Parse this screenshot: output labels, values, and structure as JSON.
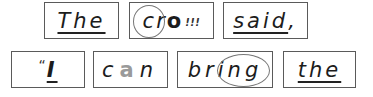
{
  "figure": {
    "rows": [
      {
        "words": [
          {
            "text": "The",
            "annotation": "underlined"
          },
          {
            "text": "crow",
            "parts": {
              "plain": "cr",
              "bold": "o",
              "marks": "!!!"
            },
            "annotation": "circled-onset"
          },
          {
            "text": "said,",
            "parts": {
              "main": "said",
              "punct": ","
            },
            "annotation": "underlined"
          }
        ]
      },
      {
        "words": [
          {
            "text": "“I",
            "parts": {
              "quote": "“",
              "main": "I"
            },
            "annotation": "underlined"
          },
          {
            "text": "can",
            "parts": {
              "a": "c",
              "b": "a",
              "c": "n"
            },
            "annotation": "gray-vowel"
          },
          {
            "text": "bring",
            "parts": {
              "a": "br",
              "b": "ing"
            },
            "annotation": "circled-ending"
          },
          {
            "text": "the",
            "annotation": "underlined"
          }
        ]
      }
    ],
    "colors": {
      "border": "#5a5a5a",
      "text": "#1c1c1c",
      "highlight_gray": "#9a9a9a",
      "circle": "#777777"
    }
  }
}
